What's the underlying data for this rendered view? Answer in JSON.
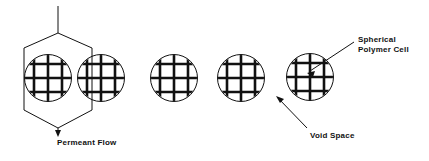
{
  "figure": {
    "background_color": "#ffffff",
    "line_color": "#111111",
    "width": 429,
    "height": 161
  },
  "labels": {
    "permeant_flow": "Permeant Flow",
    "void_space": "Void Space",
    "spherical_polymer_cell_line1": "Spherical",
    "spherical_polymer_cell_line2": "Polymer Cell"
  },
  "cells": [
    {
      "id": "cell-1",
      "cx": 48,
      "cy": 78,
      "r": 24
    },
    {
      "id": "cell-2",
      "cx": 101,
      "cy": 78,
      "r": 24
    },
    {
      "id": "cell-3",
      "cx": 174,
      "cy": 78,
      "r": 24
    },
    {
      "id": "cell-4",
      "cx": 241,
      "cy": 78,
      "r": 24
    },
    {
      "id": "cell-5",
      "cx": 310,
      "cy": 77,
      "r": 24
    }
  ],
  "grid": {
    "rows": 3,
    "columns": 3,
    "line_width": 2.6
  },
  "flow_channel": {
    "inlet_x": 58,
    "inlet_top_y": 6,
    "outlet_arrow_y": 136,
    "hexagon_points": "58,33 24,48 24,110 58,128 92,110 92,48"
  },
  "leader_lines": {
    "void_space": {
      "from_x": 307,
      "from_y": 128,
      "to_x": 276,
      "to_y": 96
    },
    "spherical_polymer_cell": {
      "from_x": 354,
      "from_y": 42,
      "to_x": 307,
      "to_y": 73
    }
  }
}
